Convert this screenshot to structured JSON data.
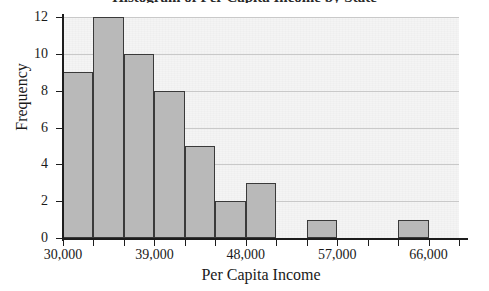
{
  "chart_data": {
    "type": "bar",
    "title": "Histogram of Per Capita Income by State",
    "xlabel": "Per Capita Income",
    "ylabel": "Frequency",
    "bin_width": 3000,
    "bin_start": 30000,
    "categories": [
      "30,000-33,000",
      "33,000-36,000",
      "36,000-39,000",
      "39,000-42,000",
      "42,000-45,000",
      "45,000-48,000",
      "48,000-51,000",
      "51,000-54,000",
      "54,000-57,000",
      "57,000-60,000",
      "60,000-63,000",
      "63,000-66,000"
    ],
    "bin_left_edges": [
      30000,
      33000,
      36000,
      39000,
      42000,
      45000,
      48000,
      51000,
      54000,
      57000,
      60000,
      63000
    ],
    "values": [
      9,
      12,
      10,
      8,
      5,
      2,
      3,
      0,
      1,
      0,
      0,
      1
    ],
    "ylim": [
      0,
      12
    ],
    "xlim": [
      30000,
      69000
    ],
    "ytick_labels": [
      "0",
      "2",
      "4",
      "6",
      "8",
      "10",
      "12"
    ],
    "ytick_values": [
      0,
      2,
      4,
      6,
      8,
      10,
      12
    ],
    "xtick_labels": [
      "30,000",
      "39,000",
      "48,000",
      "57,000",
      "66,000"
    ],
    "xtick_values": [
      30000,
      39000,
      48000,
      57000,
      66000
    ],
    "grid": true,
    "legend": false,
    "bar_fill_color": "#b9b9b9",
    "bar_edge_color": "#3a3a3a",
    "plot_background_color": "#f4f4f4",
    "gridline_color": "#c9c9c9",
    "axis_color": "#1d1d1d"
  }
}
